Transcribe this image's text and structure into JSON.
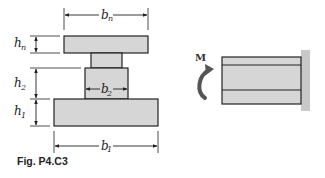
{
  "figure": {
    "caption": "Fig. P4.C3",
    "cross_section": {
      "dimensions": {
        "b_n": {
          "base": "b",
          "sub": "n"
        },
        "b_2": {
          "base": "b",
          "sub": "2"
        },
        "b_1": {
          "base": "b",
          "sub": "1"
        },
        "h_n": {
          "base": "h",
          "sub": "n"
        },
        "h_2": {
          "base": "h",
          "sub": "2"
        },
        "h_1": {
          "base": "h",
          "sub": "1"
        }
      }
    },
    "beam": {
      "moment_label": "M"
    },
    "colors": {
      "fill": "#d6d6d6",
      "stroke": "#222222",
      "wall": "#c8c8c8",
      "arrow": "#555555"
    }
  }
}
